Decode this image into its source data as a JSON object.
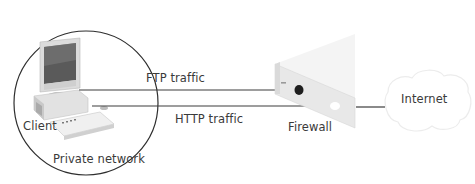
{
  "diagram": {
    "type": "network-diagram",
    "nodes": [
      {
        "id": "client",
        "label": "Client"
      },
      {
        "id": "private_network",
        "label": "Private network"
      },
      {
        "id": "firewall",
        "label": "Firewall"
      },
      {
        "id": "internet",
        "label": "Internet"
      }
    ],
    "edges": [
      {
        "from": "client",
        "to": "firewall",
        "label": "FTP traffic",
        "terminal": "blocked-port-dark"
      },
      {
        "from": "client",
        "to": "firewall",
        "label": "HTTP traffic",
        "terminal": "open-port-white"
      },
      {
        "from": "firewall",
        "to": "internet",
        "label": ""
      }
    ],
    "colors": {
      "line": "#3c3c3c",
      "firewall_face": "#e9e9e9",
      "firewall_top": "#f3f3f3",
      "cloud": "#ececec"
    }
  },
  "labels": {
    "client": "Client",
    "private_network": "Private network",
    "ftp": "FTP traffic",
    "http": "HTTP traffic",
    "firewall": "Firewall",
    "internet": "Internet"
  }
}
